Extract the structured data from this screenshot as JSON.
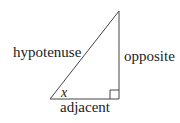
{
  "diagram": {
    "type": "right-triangle",
    "stroke_color": "#444444",
    "background": "#ffffff",
    "vertices": {
      "top": [
        119,
        11
      ],
      "bottom_left": [
        50,
        99
      ],
      "right_angle": [
        119,
        99
      ]
    },
    "labels": {
      "hypotenuse": "hypotenuse",
      "opposite": "opposite",
      "adjacent": "adjacent",
      "angle": "x"
    }
  }
}
